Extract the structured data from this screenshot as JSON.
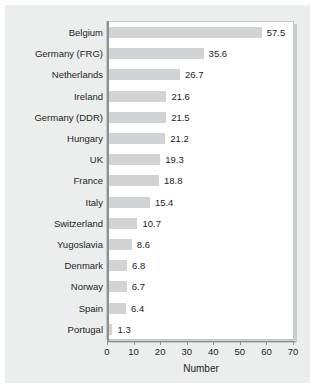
{
  "chart_data": {
    "type": "bar",
    "orientation": "horizontal",
    "title": "",
    "xlabel": "Number",
    "ylabel": "",
    "xlim": [
      0,
      70
    ],
    "xticks": [
      0,
      10,
      20,
      30,
      40,
      50,
      60,
      70
    ],
    "grid": false,
    "legend": null,
    "bar_color": "#d2d3d4",
    "background_color": "#eceded",
    "plot_background_color": "#ffffff",
    "axis_color": "#8e9192",
    "text_color": "#1d1d1d",
    "categories": [
      "Belgium",
      "Germany (FRG)",
      "Netherlands",
      "Ireland",
      "Germany (DDR)",
      "Hungary",
      "UK",
      "France",
      "Italy",
      "Switzerland",
      "Yugoslavia",
      "Denmark",
      "Norway",
      "Spain",
      "Portugal"
    ],
    "values": [
      57.5,
      35.6,
      26.7,
      21.6,
      21.5,
      21.2,
      19.3,
      18.8,
      15.4,
      10.7,
      8.6,
      6.8,
      6.7,
      6.4,
      1.3
    ],
    "value_labels": [
      "57.5",
      "35.6",
      "26.7",
      "21.6",
      "21.5",
      "21.2",
      "19.3",
      "18.8",
      "15.4",
      "10.7",
      "8.6",
      "6.8",
      "6.7",
      "6.4",
      "1.3"
    ],
    "tick_labels": [
      "0",
      "10",
      "20",
      "30",
      "40",
      "50",
      "60",
      "70"
    ]
  }
}
